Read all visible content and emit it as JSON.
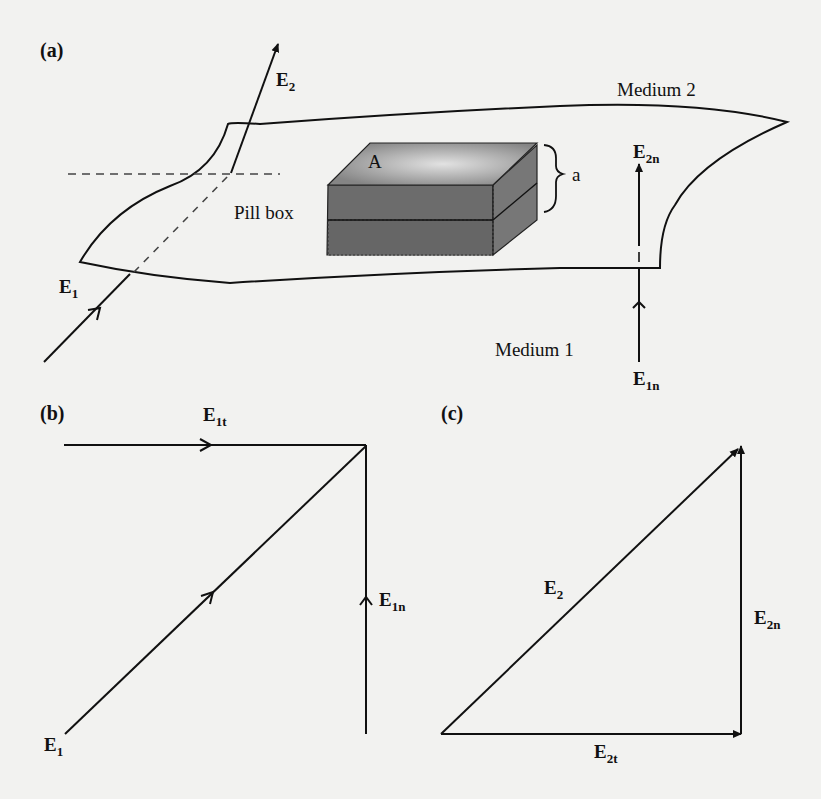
{
  "figure": {
    "panels": {
      "a": {
        "label": "(a)"
      },
      "b": {
        "label": "(b)"
      },
      "c": {
        "label": "(c)"
      }
    },
    "panel_a": {
      "medium_top": "Medium 2",
      "medium_bottom": "Medium 1",
      "pillbox_label": "Pill box",
      "area_label": "A",
      "height_label": "a",
      "vectors": {
        "E2": {
          "base": "E",
          "sub": "2"
        },
        "E1": {
          "base": "E",
          "sub": "1"
        },
        "E2n": {
          "base": "E",
          "sub": "2n"
        },
        "E1n": {
          "base": "E",
          "sub": "1n"
        }
      }
    },
    "panel_b": {
      "vectors": {
        "E1t": {
          "base": "E",
          "sub": "1t"
        },
        "E1n": {
          "base": "E",
          "sub": "1n"
        },
        "E1": {
          "base": "E",
          "sub": "1"
        }
      }
    },
    "panel_c": {
      "vectors": {
        "E2": {
          "base": "E",
          "sub": "2"
        },
        "E2n": {
          "base": "E",
          "sub": "2n"
        },
        "E2t": {
          "base": "E",
          "sub": "2t"
        }
      }
    },
    "colors": {
      "background": "#f2f2f0",
      "ink": "#111111",
      "box_top_light": "#d6d6d6",
      "box_top_dark": "#8a8a8a",
      "box_side": "#6e6e6e",
      "box_front": "#6a6a6a"
    }
  }
}
